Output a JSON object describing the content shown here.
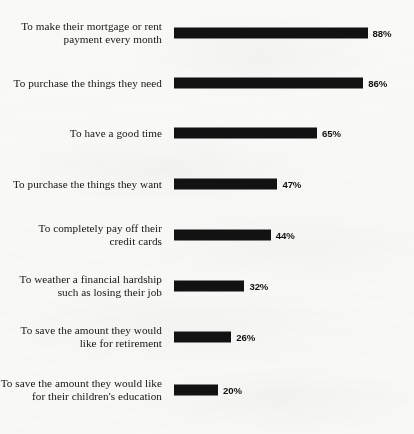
{
  "chart_data": {
    "type": "bar",
    "orientation": "horizontal",
    "title": "",
    "xlabel": "",
    "ylabel": "",
    "xlim": [
      0,
      100
    ],
    "grid": false,
    "legend": null,
    "value_suffix": "%",
    "categories": [
      "To make their mortgage or rent\npayment every month",
      "To purchase the things they need",
      "To have a good time",
      "To purchase the things they want",
      "To completely pay off their\ncredit cards",
      "To weather a financial hardship\nsuch as losing their job",
      "To save the amount they would\nlike for retirement",
      "To save the amount they would like\nfor their children's education"
    ],
    "values": [
      88,
      86,
      65,
      47,
      44,
      32,
      26,
      20
    ],
    "value_labels": [
      "88%",
      "86%",
      "65%",
      "47%",
      "44%",
      "32%",
      "26%",
      "20%"
    ],
    "bar_color": "#121212",
    "background_color": "#f9f9f8"
  },
  "layout": {
    "bar_left_px": 174,
    "row_top_px": [
      16,
      66,
      116,
      167,
      218,
      269,
      320,
      373
    ],
    "px_per_percent": 2.2
  }
}
